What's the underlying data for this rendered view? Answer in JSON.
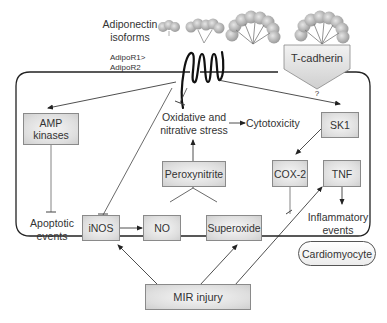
{
  "diagram": {
    "title_labels": {
      "adiponectin": "Adiponectin",
      "isoforms": "isoforms",
      "receptor_line1": "AdipoR1>",
      "receptor_line2": "AdipoR2",
      "t_cadherin": "T-cadherin",
      "question": "?"
    },
    "nodes": {
      "amp_line1": "AMP",
      "amp_line2": "kinases",
      "oxidative_line1": "Oxidative and",
      "oxidative_line2": "nitrative stress",
      "cytotoxicity": "Cytotoxicity",
      "sk1": "SK1",
      "peroxynitrite": "Peroxynitrite",
      "cox2": "COX-2",
      "tnf": "TNF",
      "apoptotic_line1": "Apoptotic",
      "apoptotic_line2": "events",
      "inos": "iNOS",
      "no": "NO",
      "superoxide": "Superoxide",
      "inflammatory_line1": "Inflammatory",
      "inflammatory_line2": "events",
      "cardiomyocyte": "Cardiomyocyte",
      "mir_injury": "MIR injury"
    },
    "edges": [
      {
        "from": "AdipoR",
        "to": "AMP kinases",
        "type": "activate"
      },
      {
        "from": "AdipoR",
        "to": "SK1",
        "type": "activate"
      },
      {
        "from": "AdipoR",
        "to": "iNOS",
        "type": "inhibit"
      },
      {
        "from": "AdipoR",
        "to": "Oxidative and nitrative stress",
        "type": "inhibit"
      },
      {
        "from": "T-cadherin",
        "to": "?",
        "type": "unknown"
      },
      {
        "from": "AMP kinases",
        "to": "Apoptotic events",
        "type": "inhibit"
      },
      {
        "from": "Oxidative and nitrative stress",
        "to": "Cytotoxicity",
        "type": "activate"
      },
      {
        "from": "Peroxynitrite",
        "to": "Oxidative and nitrative stress",
        "type": "activate"
      },
      {
        "from": "NO",
        "to": "Peroxynitrite",
        "type": "activate"
      },
      {
        "from": "Superoxide",
        "to": "Peroxynitrite",
        "type": "activate"
      },
      {
        "from": "iNOS",
        "to": "NO",
        "type": "activate"
      },
      {
        "from": "SK1",
        "to": "COX-2",
        "type": "activate"
      },
      {
        "from": "COX-2",
        "to": "MIR injury path",
        "type": "inhibit"
      },
      {
        "from": "TNF",
        "to": "Inflammatory events",
        "type": "activate"
      },
      {
        "from": "MIR injury",
        "to": "iNOS",
        "type": "activate"
      },
      {
        "from": "MIR injury",
        "to": "Superoxide",
        "type": "activate"
      },
      {
        "from": "MIR injury",
        "to": "TNF",
        "type": "activate"
      }
    ],
    "colors": {
      "box_fill": "#dedede",
      "box_border": "#8a8a8a",
      "line": "#333333",
      "membrane": "#222222",
      "protein": "#bdbdbd"
    }
  }
}
